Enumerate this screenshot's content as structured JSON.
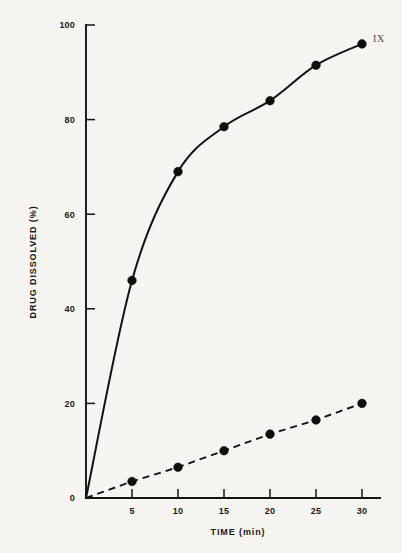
{
  "chart_data": {
    "type": "line",
    "title": "",
    "xlabel": "TIME (min)",
    "ylabel": "DRUG DISSOLVED (%)",
    "xlim": [
      0,
      30
    ],
    "ylim": [
      0,
      100
    ],
    "grid": false,
    "legend_position": "inline-right",
    "x": [
      0,
      5,
      10,
      15,
      20,
      25,
      30
    ],
    "xticks": [
      "5",
      "10",
      "15",
      "20",
      "25",
      "30"
    ],
    "xtick_values": [
      5,
      10,
      15,
      20,
      25,
      30
    ],
    "yticks": [
      "0",
      "20",
      "40",
      "60",
      "80",
      "100"
    ],
    "ytick_values": [
      0,
      20,
      40,
      60,
      80,
      100
    ],
    "series": [
      {
        "name": "IX",
        "style": "solid",
        "marker": "filled-circle",
        "annotation": "IX",
        "values": [
          0,
          46,
          69,
          78.5,
          84,
          91.5,
          96
        ]
      },
      {
        "name": "slow-release",
        "style": "dashed",
        "marker": "filled-circle",
        "annotation": "",
        "values": [
          0,
          3.5,
          6.5,
          10,
          13.5,
          16.5,
          20
        ]
      }
    ]
  },
  "axes": {
    "y_title": "DRUG DISSOLVED (%)",
    "x_title": "TIME (min)",
    "y_tick_labels": [
      "100",
      "80",
      "60",
      "40",
      "20",
      "0"
    ],
    "x_tick_labels": [
      "5",
      "10",
      "15",
      "20",
      "25",
      "30"
    ]
  },
  "annotations": {
    "top_right_series_label": "IX"
  },
  "colors": {
    "ink": "#141414",
    "paper": "#f7f6f2",
    "marker": "#0f0f0f",
    "annotation": "#4a4a4a"
  }
}
